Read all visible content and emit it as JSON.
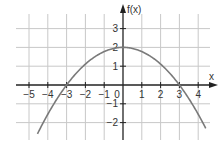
{
  "chart_data": {
    "type": "line",
    "title": "",
    "function": "f(x) = 2 - (2/9)x^2",
    "xlabel": "x",
    "ylabel": "f(x)",
    "xlim": [
      -5.5,
      4.6
    ],
    "ylim": [
      -2.9,
      3.8
    ],
    "x_ticks": [
      -5,
      -4,
      -3,
      -2,
      -1,
      0,
      1,
      2,
      3,
      4
    ],
    "x_tick_labels": [
      "-5",
      "-4",
      "-3",
      "-2",
      "-1",
      "0",
      "1",
      "2",
      "3",
      "4"
    ],
    "y_ticks": [
      -2,
      -1,
      1,
      2,
      3
    ],
    "y_tick_labels": [
      "-2",
      "-1",
      "1",
      "2",
      "3"
    ],
    "grid": true,
    "series": [
      {
        "name": "f(x)",
        "color": "#777777",
        "x": [
          -4.5,
          -4,
          -3,
          -2,
          -1,
          0,
          1,
          2,
          3,
          4,
          4.4
        ],
        "y": [
          -2.5,
          -1.56,
          0,
          1.11,
          1.78,
          2,
          1.78,
          1.11,
          0,
          -1.56,
          -2.3
        ]
      }
    ],
    "annotations": [
      {
        "text": "vertex",
        "x": 0,
        "y": 2
      },
      {
        "text": "root",
        "x": -3,
        "y": 0
      },
      {
        "text": "root",
        "x": 3,
        "y": 0
      }
    ]
  },
  "colors": {
    "grid": "#c8c8c8",
    "axis": "#222222",
    "curve": "#7a7a7a",
    "text": "#333333"
  }
}
